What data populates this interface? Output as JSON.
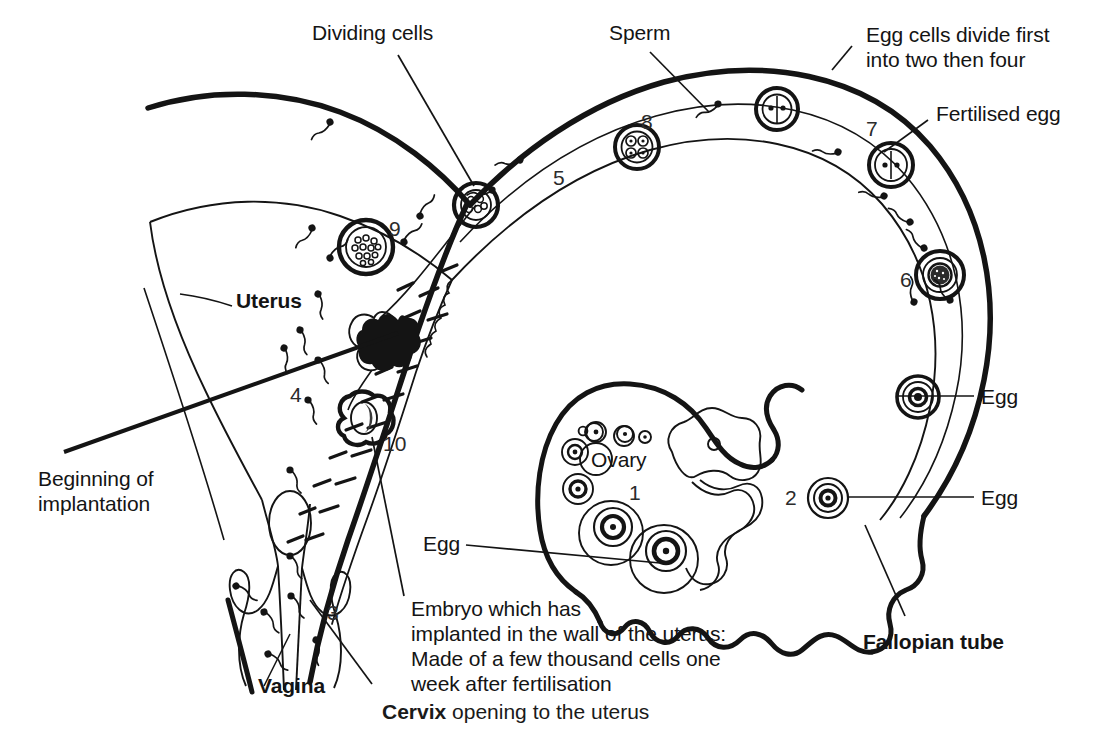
{
  "figure": {
    "type": "anatomical-diagram",
    "background": "#ffffff",
    "ink": "#141414"
  },
  "labels": {
    "dividing_cells": "Dividing cells",
    "sperm": "Sperm",
    "egg_cells_divide": "Egg cells divide first\ninto two then four",
    "fertilised_egg": "Fertilised egg",
    "uterus": "Uterus",
    "beginning_of_implantation": "Beginning of\nimplantation",
    "ovary": "Ovary",
    "egg_ovary": "Egg",
    "egg_right_upper": "Egg",
    "egg_right_lower": "Egg",
    "fallopian_tube": "Fallopian tube",
    "vagina": "Vagina",
    "embryo_note": "Embryo which has\nimplanted in the wall of the uterus:\nMade of a few thousand cells one\nweek after fertilisation",
    "cervix_bold": "Cervix",
    "cervix_rest": " opening to the uterus"
  },
  "numbers": {
    "n1": "1",
    "n2": "2",
    "n3": "3",
    "n4": "4",
    "n5": "5",
    "n6": "6",
    "n7": "7",
    "n8": "8",
    "n9": "9",
    "n10": "10"
  },
  "stages": [
    {
      "id": "1",
      "name": "ovary-follicles",
      "description": "Ovary containing developing follicles and eggs"
    },
    {
      "id": "2",
      "name": "egg-released",
      "description": "Egg released from ovary into funnel of fallopian tube"
    },
    {
      "id": "3",
      "name": "vagina-sperm",
      "description": "Sperm entering through the vagina"
    },
    {
      "id": "4",
      "name": "uterus-sperm",
      "description": "Sperm swimming up through the uterus"
    },
    {
      "id": "5",
      "name": "sperm-in-tube",
      "description": "Sperm travelling along the fallopian tube"
    },
    {
      "id": "6",
      "name": "fertilisation",
      "description": "Sperm meeting the egg - fertilisation"
    },
    {
      "id": "7",
      "name": "two-cell-stage",
      "description": "Fertilised egg divided into two cells"
    },
    {
      "id": "8",
      "name": "four-cell-stage",
      "description": "Egg divided into four cells"
    },
    {
      "id": "9",
      "name": "blastocyst",
      "description": "Ball of many cells free in the uterus"
    },
    {
      "id": "10",
      "name": "implanted-embryo",
      "description": "Embryo implanted in the wall of the uterus"
    }
  ]
}
